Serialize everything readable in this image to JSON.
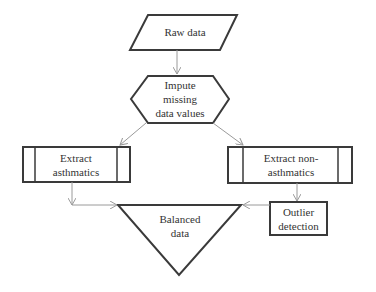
{
  "diagram": {
    "type": "flowchart",
    "nodes": [
      {
        "id": "raw",
        "shape": "parallelogram",
        "label": "Raw data"
      },
      {
        "id": "impute",
        "shape": "hexagon",
        "label": "Impute\nmissing\ndata values"
      },
      {
        "id": "asth",
        "shape": "predefined-process",
        "label": "Extract\nasthmatics"
      },
      {
        "id": "nonasth",
        "shape": "predefined-process",
        "label": "Extract non-\nasthmatics"
      },
      {
        "id": "outlier",
        "shape": "rectangle",
        "label": "Outlier\ndetection"
      },
      {
        "id": "balanced",
        "shape": "inverted-triangle",
        "label": "Balanced\ndata"
      }
    ],
    "edges": [
      {
        "from": "raw",
        "to": "impute"
      },
      {
        "from": "impute",
        "to": "asth"
      },
      {
        "from": "impute",
        "to": "nonasth"
      },
      {
        "from": "asth",
        "to": "balanced"
      },
      {
        "from": "nonasth",
        "to": "outlier"
      },
      {
        "from": "outlier",
        "to": "balanced"
      }
    ],
    "colors": {
      "shape_stroke": "#3a3a3a",
      "arrow_stroke": "#9a9a9a",
      "text": "#333333"
    }
  }
}
